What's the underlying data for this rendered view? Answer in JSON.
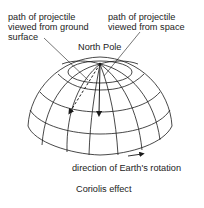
{
  "diagram": {
    "title": "Coriolis effect",
    "labels": {
      "ground_path": [
        "path of projectile",
        "viewed from ground",
        "surface"
      ],
      "space_path": [
        "path of projectile",
        "viewed from space"
      ],
      "north_pole": "North Pole",
      "rotation": "direction of Earth's rotation"
    },
    "caption": "Coriolis effect",
    "colors": {
      "line": "#1a1a1a",
      "background": "#ffffff"
    }
  }
}
